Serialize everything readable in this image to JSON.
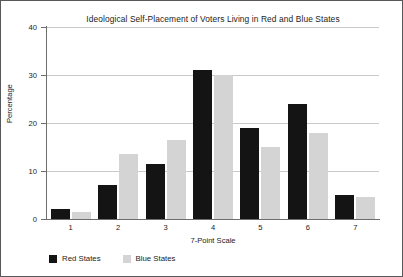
{
  "chart_data": {
    "type": "bar",
    "title": "Ideological Self-Placement of Voters Living in Red and Blue States",
    "xlabel": "7-Point Scale",
    "ylabel": "Percentage",
    "categories": [
      "1",
      "2",
      "3",
      "4",
      "5",
      "6",
      "7"
    ],
    "series": [
      {
        "name": "Red States",
        "color": "#141414",
        "values": [
          2,
          7,
          11.5,
          31,
          19,
          24,
          5
        ]
      },
      {
        "name": "Blue States",
        "color": "#d4d4d4",
        "values": [
          1.5,
          13.5,
          16.5,
          30,
          15,
          18,
          4.5
        ]
      }
    ],
    "ylim": [
      0,
      40
    ],
    "yticks": [
      0,
      10,
      20,
      30,
      40
    ],
    "grid": true,
    "legend_position": "bottom-left"
  },
  "legend": {
    "items": [
      {
        "label": "Red States"
      },
      {
        "label": "Blue States"
      }
    ]
  }
}
